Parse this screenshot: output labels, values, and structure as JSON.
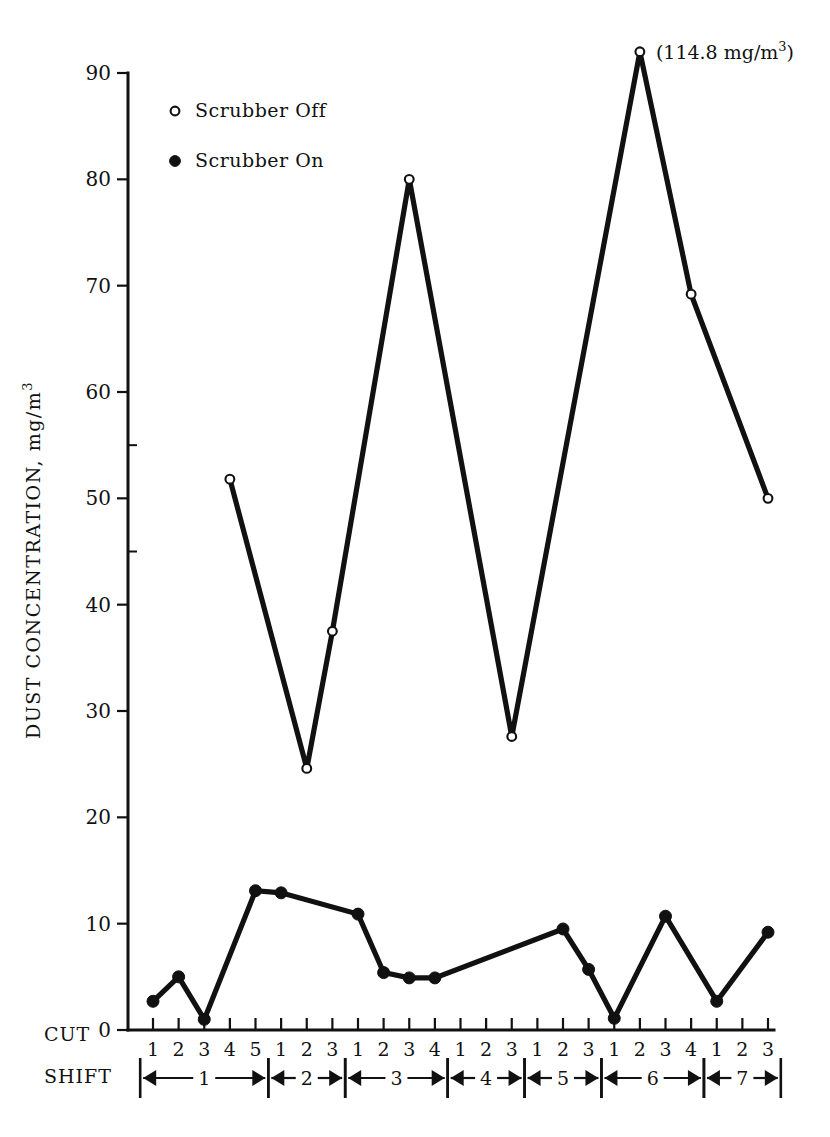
{
  "chart_data": {
    "type": "line",
    "title": "",
    "xlabel": "CUT / SHIFT",
    "ylabel": "DUST CONCENTRATION, mg/m",
    "ylabel_superscript": "3",
    "ylim": [
      0,
      90
    ],
    "ytick_values": [
      0,
      10,
      20,
      30,
      40,
      50,
      60,
      70,
      80,
      90
    ],
    "ytick_labels": [
      "0",
      "10",
      "20",
      "30",
      "40",
      "50",
      "60",
      "70",
      "80",
      "90"
    ],
    "grid": false,
    "legend_position": "upper-left-inside",
    "x_axis_kind": "categorical-cuts-grouped-by-shift",
    "cut_labels": [
      "1",
      "2",
      "3",
      "4",
      "5",
      "1",
      "2",
      "3",
      "1",
      "2",
      "3",
      "4",
      "1",
      "2",
      "3",
      "1",
      "2",
      "3",
      "1",
      "2",
      "3",
      "4",
      "1",
      "2",
      "3"
    ],
    "shift_groups": [
      {
        "shift": "1",
        "cuts": 5
      },
      {
        "shift": "2",
        "cuts": 3
      },
      {
        "shift": "3",
        "cuts": 4
      },
      {
        "shift": "4",
        "cuts": 3
      },
      {
        "shift": "5",
        "cuts": 3
      },
      {
        "shift": "6",
        "cuts": 4
      },
      {
        "shift": "7",
        "cuts": 3
      }
    ],
    "row_labels": {
      "cut": "CUT",
      "shift": "SHIFT"
    },
    "series": [
      {
        "name": "Scrubber Off",
        "marker": "open-circle",
        "points": [
          {
            "index": 3,
            "shift": "1",
            "cut": "4",
            "value": 51.8
          },
          {
            "index": 6,
            "shift": "2",
            "cut": "2",
            "value": 24.6
          },
          {
            "index": 7,
            "shift": "2",
            "cut": "3",
            "value": 37.5
          },
          {
            "index": 10,
            "shift": "3",
            "cut": "3",
            "value": 80.0
          },
          {
            "index": 14,
            "shift": "4",
            "cut": "3",
            "value": 27.6
          },
          {
            "index": 19,
            "shift": "6",
            "cut": "2",
            "value": 92.0,
            "clipped": true,
            "true_value_label": "114.8"
          },
          {
            "index": 21,
            "shift": "6",
            "cut": "4",
            "value": 69.2
          },
          {
            "index": 24,
            "shift": "7",
            "cut": "3",
            "value": 50.0
          }
        ]
      },
      {
        "name": "Scrubber On",
        "marker": "filled-circle",
        "points": [
          {
            "index": 0,
            "shift": "1",
            "cut": "1",
            "value": 2.7
          },
          {
            "index": 1,
            "shift": "1",
            "cut": "2",
            "value": 5.0
          },
          {
            "index": 2,
            "shift": "1",
            "cut": "3",
            "value": 1.0
          },
          {
            "index": 4,
            "shift": "1",
            "cut": "5",
            "value": 13.1
          },
          {
            "index": 5,
            "shift": "2",
            "cut": "1",
            "value": 12.9
          },
          {
            "index": 8,
            "shift": "3",
            "cut": "1",
            "value": 10.9
          },
          {
            "index": 9,
            "shift": "3",
            "cut": "2",
            "value": 5.4
          },
          {
            "index": 10,
            "shift": "3",
            "cut": "3",
            "value": 4.9
          },
          {
            "index": 11,
            "shift": "3",
            "cut": "4",
            "value": 4.9
          },
          {
            "index": 16,
            "shift": "5",
            "cut": "2",
            "value": 9.5
          },
          {
            "index": 17,
            "shift": "5",
            "cut": "3",
            "value": 5.7
          },
          {
            "index": 18,
            "shift": "6",
            "cut": "1",
            "value": 1.1
          },
          {
            "index": 20,
            "shift": "6",
            "cut": "3",
            "value": 10.7
          },
          {
            "index": 22,
            "shift": "7",
            "cut": "1",
            "value": 2.7
          },
          {
            "index": 24,
            "shift": "7",
            "cut": "3",
            "value": 9.2
          }
        ]
      }
    ],
    "annotations": [
      {
        "text": "(114.8 mg/m",
        "superscript": "3",
        "text_after": ")",
        "at_index": 19,
        "note": "off-scale value for shift 6 cut 2"
      }
    ]
  },
  "legend": {
    "items": [
      {
        "marker": "open-circle",
        "label": "Scrubber Off"
      },
      {
        "marker": "filled-circle",
        "label": "Scrubber On"
      }
    ]
  },
  "axis": {
    "y_title_main": "DUST CONCENTRATION, mg/m",
    "y_title_sup": "3"
  },
  "colors": {
    "ink": "#111111",
    "background": "#ffffff"
  }
}
